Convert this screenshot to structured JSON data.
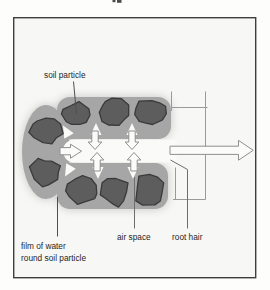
{
  "figure": {
    "labels": {
      "soil_particle": "soil particle",
      "film_of_water_line1": "film of water",
      "film_of_water_line2": "round soil particle",
      "air_space": "air space",
      "root_hair": "root hair"
    },
    "colors": {
      "background": "#f7f7f5",
      "frame_border": "#3e3e3e",
      "particle_fill": "#5d5d5d",
      "particle_outline": "#3a3a3a",
      "water_film": "#a6a6a6",
      "water_film_halo": "#c5c5c2",
      "air_space_fill": "#fafaf8",
      "arrow_fill": "#fbfbfa",
      "arrow_outline": "#8f8f8f",
      "structure_line": "#9a9a9a",
      "pointer_line": "#4f4f4f",
      "label_text": "#1f1f1f"
    },
    "elements": {
      "soil_particles": 8,
      "air_space_wedges": 6,
      "water_entry_arrows": 5,
      "water_flow_arrows": 1
    }
  }
}
